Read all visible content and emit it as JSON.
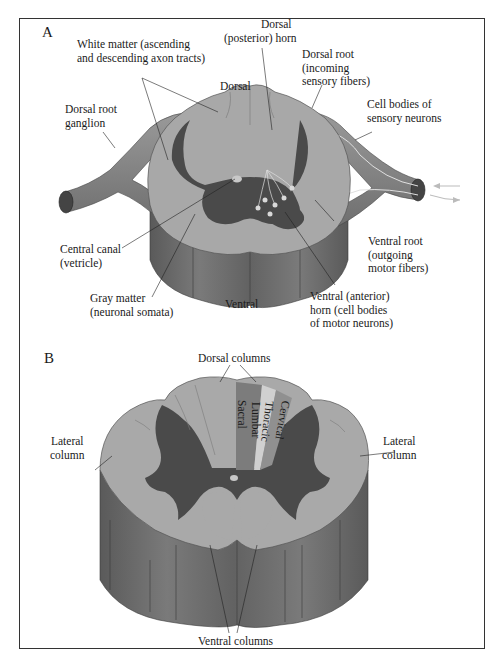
{
  "figure": {
    "panels": [
      {
        "id": "A",
        "label": "A",
        "title": "Spinal cord cross-section with roots",
        "labels": {
          "white_matter_1": "White matter (ascending",
          "white_matter_2": "and descending axon tracts)",
          "dorsal_horn_1": "Dorsal",
          "dorsal_horn_2": "(posterior) horn",
          "dorsal": "Dorsal",
          "dorsal_root_1": "Dorsal root",
          "dorsal_root_2": "(incoming",
          "dorsal_root_3": "sensory fibers)",
          "drg_1": "Dorsal root",
          "drg_2": "ganglion",
          "cell_bodies_1": "Cell bodies of",
          "cell_bodies_2": "sensory neurons",
          "central_canal_1": "Central canal",
          "central_canal_2": "(vetricle)",
          "ventral_root_1": "Ventral root",
          "ventral_root_2": "(outgoing",
          "ventral_root_3": "motor fibers)",
          "gray_matter_1": "Gray matter",
          "gray_matter_2": "(neuronal somata)",
          "ventral": "Ventral",
          "ventral_horn_1": "Ventral (anterior)",
          "ventral_horn_2": "horn (cell bodies",
          "ventral_horn_3": "of motor neurons)"
        }
      },
      {
        "id": "B",
        "label": "B",
        "title": "Spinal cord columns",
        "labels": {
          "dorsal_columns": "Dorsal columns",
          "lateral_left_1": "Lateral",
          "lateral_left_2": "column",
          "lateral_right_1": "Lateral",
          "lateral_right_2": "column",
          "ventral_columns": "Ventral columns",
          "sacral": "Sacral",
          "lumbar": "Lumbar",
          "thoracic": "Thoracic",
          "cervical": "Cervical"
        }
      }
    ],
    "colors": {
      "white_matter": "#a9a9a9",
      "gray_matter": "#4a4a4a",
      "cord_side": "#6e6e6e",
      "root": "#8c8c8c",
      "lumbar_band": "#7c7c7c",
      "thoracic_band": "#d0d0d0",
      "cervical_band": "#909090",
      "frame": "#333333"
    }
  }
}
